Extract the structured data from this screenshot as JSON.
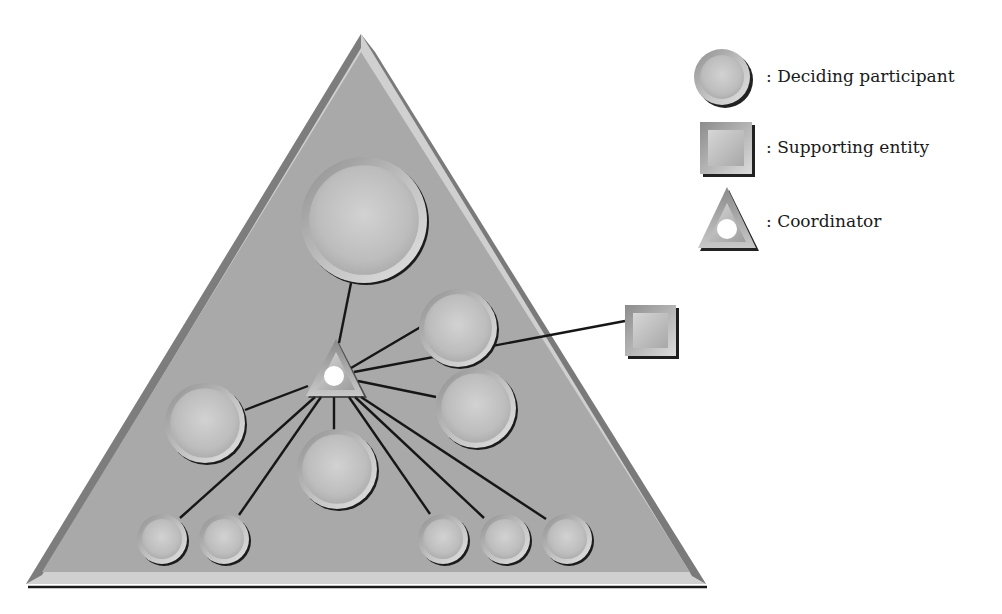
{
  "diagram": {
    "type": "network-organization",
    "outer_shape": {
      "kind": "triangle",
      "apex": [
        361,
        34
      ],
      "base_left": [
        26,
        583
      ],
      "base_right": [
        705,
        583
      ],
      "fill": "#a9a9a9",
      "border_fill": "#d2d2d2",
      "edge_dark": "#6f6f6f"
    },
    "coordinator": {
      "apex": [
        336,
        340
      ],
      "base_left": [
        306,
        397
      ],
      "base_right": [
        365,
        397
      ],
      "hole_center": [
        334,
        376
      ],
      "hole_radius": 10
    },
    "participants": [
      {
        "id": "p-top",
        "cx": 364,
        "cy": 220,
        "r": 63
      },
      {
        "id": "p-right-upper",
        "cx": 458,
        "cy": 328,
        "r": 39
      },
      {
        "id": "p-right-mid",
        "cx": 476,
        "cy": 408,
        "r": 40
      },
      {
        "id": "p-left",
        "cx": 205,
        "cy": 423,
        "r": 40
      },
      {
        "id": "p-center-bottom",
        "cx": 337,
        "cy": 469,
        "r": 40
      },
      {
        "id": "p-small-1",
        "cx": 162,
        "cy": 539,
        "r": 25
      },
      {
        "id": "p-small-2",
        "cx": 224,
        "cy": 539,
        "r": 25
      },
      {
        "id": "p-small-3",
        "cx": 443,
        "cy": 539,
        "r": 25
      },
      {
        "id": "p-small-4",
        "cx": 505,
        "cy": 539,
        "r": 25
      },
      {
        "id": "p-small-5",
        "cx": 567,
        "cy": 539,
        "r": 25
      }
    ],
    "supporting_entities": [
      {
        "id": "s-1",
        "x": 625,
        "y": 305,
        "w": 51,
        "h": 51
      }
    ],
    "links": [
      {
        "from": [
          339,
          343
        ],
        "to": [
          351,
          283
        ]
      },
      {
        "from": [
          351,
          368
        ],
        "to": [
          424,
          325
        ]
      },
      {
        "from": [
          354,
          372
        ],
        "to": [
          625,
          321
        ]
      },
      {
        "from": [
          358,
          381
        ],
        "to": [
          436,
          397
        ]
      },
      {
        "from": [
          308,
          386
        ],
        "to": [
          245,
          410
        ]
      },
      {
        "from": [
          315,
          397
        ],
        "to": [
          180,
          518
        ]
      },
      {
        "from": [
          321,
          397
        ],
        "to": [
          239,
          515
        ]
      },
      {
        "from": [
          334,
          397
        ],
        "to": [
          334,
          430
        ]
      },
      {
        "from": [
          349,
          397
        ],
        "to": [
          430,
          514
        ]
      },
      {
        "from": [
          355,
          397
        ],
        "to": [
          484,
          518
        ]
      },
      {
        "from": [
          361,
          397
        ],
        "to": [
          546,
          519
        ]
      }
    ]
  },
  "legend": {
    "items": [
      {
        "icon": "circle",
        "label": ": Deciding participant"
      },
      {
        "icon": "square",
        "label": ": Supporting entity"
      },
      {
        "icon": "triangle",
        "label": ": Coordinator"
      }
    ]
  }
}
